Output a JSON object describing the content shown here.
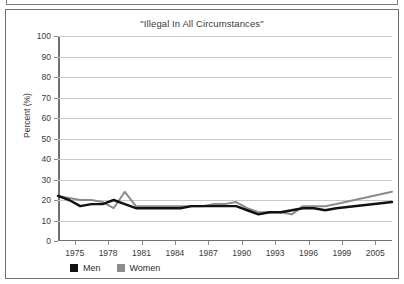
{
  "figure": {
    "title": "\"Illegal In All Circumstances\""
  },
  "legend": {
    "items": [
      {
        "label": "Men",
        "color": "#111111",
        "swatch": "legend-swatch-men"
      },
      {
        "label": "Women",
        "color": "#8c8c8c",
        "swatch": "legend-swatch-women"
      }
    ]
  },
  "chart_data": {
    "type": "line",
    "title": "\"Illegal In All Circumstances\"",
    "xlabel": "",
    "ylabel": "Percent (%)",
    "ylim": [
      0,
      100
    ],
    "ytick_step": 10,
    "yticks": [
      0,
      10,
      20,
      30,
      40,
      50,
      60,
      70,
      80,
      90,
      100
    ],
    "grid": true,
    "grid_axis": "y",
    "legend_position": "bottom-left",
    "xticks": [
      "1975",
      "1978",
      "1981",
      "1984",
      "1987",
      "1990",
      "1993",
      "1996",
      "1999",
      "2005"
    ],
    "x": [
      1975,
      1976,
      1977,
      1978,
      1979,
      1980,
      1981,
      1982,
      1983,
      1984,
      1985,
      1986,
      1987,
      1988,
      1989,
      1990,
      1991,
      1992,
      1993,
      1994,
      1995,
      1996,
      1997,
      1998,
      1999,
      2000,
      2005
    ],
    "series": [
      {
        "name": "Men",
        "color": "#111111",
        "values": [
          22,
          20,
          17,
          18,
          18,
          20,
          18,
          16,
          16,
          16,
          16,
          16,
          17,
          17,
          17,
          17,
          17,
          15,
          13,
          14,
          14,
          15,
          16,
          16,
          15,
          16,
          19
        ]
      },
      {
        "name": "Women",
        "color": "#8c8c8c",
        "values": [
          22,
          21,
          20,
          20,
          19,
          16,
          24,
          17,
          17,
          17,
          17,
          17,
          17,
          17,
          18,
          18,
          19,
          16,
          14,
          14,
          14,
          13,
          17,
          17,
          17,
          18,
          24
        ]
      }
    ]
  }
}
